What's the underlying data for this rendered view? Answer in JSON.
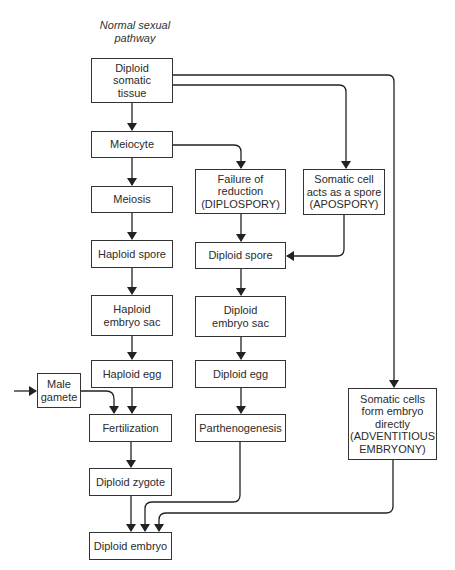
{
  "diagram": {
    "title": "Normal sexual\npathway",
    "nodes": {
      "diploid_somatic_tissue": "Diploid\nsomatic\ntissue",
      "meiocyte": "Meiocyte",
      "meiosis": "Meiosis",
      "haploid_spore": "Haploid spore",
      "haploid_embryo_sac": "Haploid\nembryo sac",
      "haploid_egg": "Haploid egg",
      "male_gamete": "Male\ngamete",
      "fertilization": "Fertilization",
      "diploid_zygote": "Diploid zygote",
      "diploid_embryo": "Diploid embryo",
      "failure_of_reduction": "Failure of\nreduction\n(DIPLOSPORY)",
      "somatic_cell_spore": "Somatic cell\nacts as a spore\n(APOSPORY)",
      "diploid_spore": "Diploid spore",
      "diploid_embryo_sac": "Diploid\nembryo sac",
      "diploid_egg": "Diploid egg",
      "parthenogenesis": "Parthenogenesis",
      "adventitious_embryony": "Somatic cells\nform embryo\ndirectly\n(ADVENTITIOUS\nEMBRYONY)"
    },
    "edges": [
      [
        "diploid_somatic_tissue",
        "meiocyte"
      ],
      [
        "meiocyte",
        "meiosis"
      ],
      [
        "meiosis",
        "haploid_spore"
      ],
      [
        "haploid_spore",
        "haploid_embryo_sac"
      ],
      [
        "haploid_embryo_sac",
        "haploid_egg"
      ],
      [
        "haploid_egg",
        "fertilization"
      ],
      [
        "male_gamete",
        "fertilization"
      ],
      [
        "fertilization",
        "diploid_zygote"
      ],
      [
        "diploid_zygote",
        "diploid_embryo"
      ],
      [
        "meiocyte",
        "failure_of_reduction"
      ],
      [
        "failure_of_reduction",
        "diploid_spore"
      ],
      [
        "diploid_somatic_tissue",
        "somatic_cell_spore"
      ],
      [
        "somatic_cell_spore",
        "diploid_spore"
      ],
      [
        "diploid_spore",
        "diploid_embryo_sac"
      ],
      [
        "diploid_embryo_sac",
        "diploid_egg"
      ],
      [
        "diploid_egg",
        "parthenogenesis"
      ],
      [
        "parthenogenesis",
        "diploid_embryo"
      ],
      [
        "diploid_somatic_tissue",
        "adventitious_embryony"
      ],
      [
        "adventitious_embryony",
        "diploid_embryo"
      ]
    ]
  }
}
